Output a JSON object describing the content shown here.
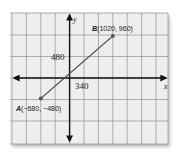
{
  "diagram": {
    "type": "coordinate-plane",
    "axes": {
      "x_label": "x",
      "y_label": "y"
    },
    "tick_labels": {
      "x": "340",
      "y": "480"
    },
    "points": [
      {
        "name": "A",
        "label": "A(−680, −480)",
        "x": -680,
        "y": -480
      },
      {
        "name": "B",
        "label": "B(1020, 960)",
        "x": 1020,
        "y": 960
      }
    ],
    "segment": "AB",
    "colors": {
      "grid_bg": "#eeeeee",
      "grid_line": "#9a9a9a",
      "axis": "#111111",
      "segment": "#555555",
      "point": "#555555"
    }
  },
  "labels": {
    "x_axis": "x",
    "y_axis": "y",
    "tick_x": "340",
    "tick_y": "480",
    "point_a_name": "A",
    "point_a_coords": "(−680, −480)",
    "point_b_name": "B",
    "point_b_coords": "(1020, 960)"
  }
}
